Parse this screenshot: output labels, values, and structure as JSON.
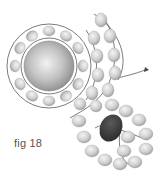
{
  "figure": {
    "caption": "fig 18",
    "colors": {
      "bead_light": "#d6d6d6",
      "bead_shade": "#9a9a9a",
      "center_bead": "#b8b8b8",
      "dark_bead": "#3a3a3a",
      "thread": "#444444"
    },
    "elements": {
      "center_bead": {
        "cx": 49,
        "cy": 66,
        "r": 25
      },
      "ring_beads": 12,
      "arc_rows": 3,
      "strap_beads": 18,
      "dark_bead_count": 1
    }
  }
}
